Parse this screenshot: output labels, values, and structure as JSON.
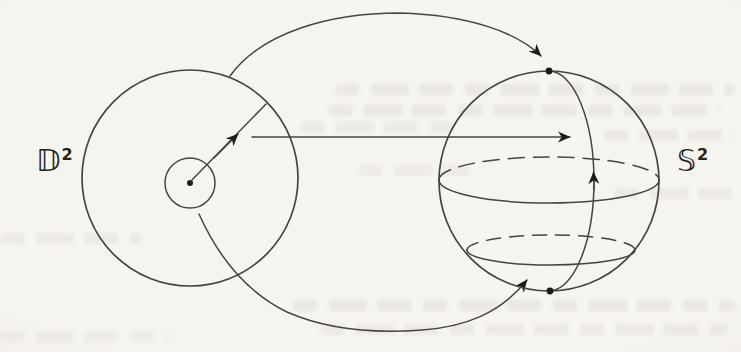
{
  "figure": {
    "labels": {
      "disk": {
        "base": "𝔻",
        "exponent": "2"
      },
      "sphere": {
        "base": "𝕊",
        "exponent": "2"
      }
    },
    "colors": {
      "ink": "#45443f",
      "dot": "#1d1c19",
      "paper": "#f6f4ee",
      "paper_edge": "#eae7de"
    }
  }
}
